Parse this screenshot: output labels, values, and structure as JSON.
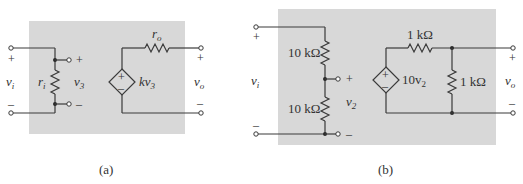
{
  "colors": {
    "panel_background": "#d8d8d8",
    "wire": "#3a3a3a",
    "text": "#333333"
  },
  "panel_a": {
    "caption": "(a)",
    "input_label_main": "v",
    "input_label_sub": "i",
    "input_plus": "+",
    "input_minus": "–",
    "input_resistor_main": "r",
    "input_resistor_sub": "i",
    "input_voltage_main": "v",
    "input_voltage_sub": "3",
    "input_voltage_plus": "+",
    "input_voltage_minus": "–",
    "source_plus": "+",
    "source_minus": "–",
    "source_label_main": "kv",
    "source_label_sub": "3",
    "output_resistor_main": "r",
    "output_resistor_sub": "o",
    "output_label_main": "v",
    "output_label_sub": "o",
    "output_plus": "+",
    "output_minus": "–"
  },
  "panel_b": {
    "caption": "(b)",
    "input_label_main": "v",
    "input_label_sub": "i",
    "input_plus": "+",
    "input_minus": "–",
    "upper_resistor": "10 kΩ",
    "lower_resistor": "10 kΩ",
    "divider_voltage_main": "v",
    "divider_voltage_sub": "2",
    "divider_plus": "+",
    "divider_minus": "–",
    "source_plus": "+",
    "source_minus": "–",
    "source_label_main": "10v",
    "source_label_sub": "2",
    "series_resistor": "1 kΩ",
    "shunt_resistor": "1 kΩ",
    "output_label_main": "v",
    "output_label_sub": "o",
    "output_plus": "+",
    "output_minus": "–"
  }
}
